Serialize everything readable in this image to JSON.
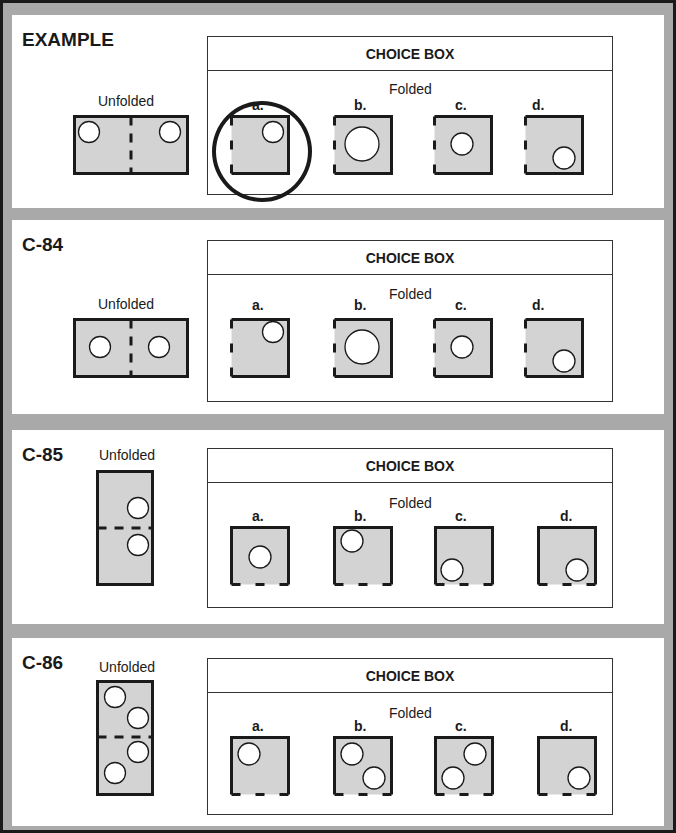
{
  "colors": {
    "paper_fill": "#d3d3d3",
    "stroke": "#1a1a1a",
    "frame": "#a9a9a9",
    "hole": "#ffffff"
  },
  "panels": [
    {
      "title": "EXAMPLE",
      "unfolded_label": "Unfolded",
      "choice_header": "CHOICE BOX",
      "folded_label": "Folded",
      "unfolded": {
        "orientation": "horizontal",
        "fold": "vertical-center",
        "holes": [
          [
            89,
            132
          ],
          [
            170,
            132
          ]
        ]
      },
      "options": [
        {
          "label": "a.",
          "holes": [
            [
              43,
              17
            ]
          ],
          "r": 11,
          "selected": true
        },
        {
          "label": "b.",
          "holes": [
            [
              29,
              29
            ]
          ],
          "r": 17
        },
        {
          "label": "c.",
          "holes": [
            [
              29,
              29
            ]
          ],
          "r": 11
        },
        {
          "label": "d.",
          "holes": [
            [
              40,
              43
            ]
          ],
          "r": 11
        }
      ],
      "open_side": "left",
      "answer": "a."
    },
    {
      "title": "C-84",
      "unfolded_label": "Unfolded",
      "choice_header": "CHOICE BOX",
      "folded_label": "Folded",
      "unfolded": {
        "orientation": "horizontal",
        "fold": "vertical-center",
        "holes": [
          [
            100,
            147
          ],
          [
            157,
            147
          ]
        ]
      },
      "options": [
        {
          "label": "a.",
          "holes": [
            [
              43,
              14
            ]
          ],
          "r": 11
        },
        {
          "label": "b.",
          "holes": [
            [
              29,
              29
            ]
          ],
          "r": 17
        },
        {
          "label": "c.",
          "holes": [
            [
              29,
              29
            ]
          ],
          "r": 11
        },
        {
          "label": "d.",
          "holes": [
            [
              40,
              43
            ]
          ],
          "r": 11
        }
      ],
      "open_side": "left"
    },
    {
      "title": "C-85",
      "unfolded_label": "Unfolded",
      "choice_header": "CHOICE BOX",
      "folded_label": "Folded",
      "unfolded": {
        "orientation": "vertical",
        "fold": "horizontal-center",
        "holes": [
          [
            42,
            38
          ],
          [
            42,
            75
          ]
        ]
      },
      "options": [
        {
          "label": "a.",
          "holes": [
            [
              30,
              31
            ]
          ],
          "r": 11
        },
        {
          "label": "b.",
          "holes": [
            [
              19,
              15
            ]
          ],
          "r": 11
        },
        {
          "label": "c.",
          "holes": [
            [
              18,
              44
            ]
          ],
          "r": 11
        },
        {
          "label": "d.",
          "holes": [
            [
              40,
              44
            ]
          ],
          "r": 11
        }
      ],
      "open_side": "bottom"
    },
    {
      "title": "C-86",
      "unfolded_label": "Unfolded",
      "choice_header": "CHOICE BOX",
      "folded_label": "Folded",
      "unfolded": {
        "orientation": "vertical",
        "fold": "horizontal-center",
        "holes": [
          [
            19,
            17
          ],
          [
            42,
            38
          ],
          [
            42,
            72
          ],
          [
            19,
            93
          ]
        ]
      },
      "options": [
        {
          "label": "a.",
          "holes": [
            [
              19,
              18
            ]
          ],
          "r": 11
        },
        {
          "label": "b.",
          "holes": [
            [
              19,
              18
            ],
            [
              41,
              42
            ]
          ],
          "r": 11
        },
        {
          "label": "c.",
          "holes": [
            [
              41,
              18
            ],
            [
              19,
              42
            ]
          ],
          "r": 11
        },
        {
          "label": "d.",
          "holes": [
            [
              42,
              42
            ]
          ],
          "r": 11
        }
      ],
      "open_side": "bottom"
    }
  ]
}
